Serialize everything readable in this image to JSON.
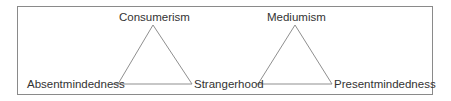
{
  "diagram": {
    "colors": {
      "border": "#8a8a8a",
      "line": "#8f8f8f",
      "text": "#333333"
    },
    "triangles": [
      {
        "top": "Consumerism",
        "left": "Absentmindedness",
        "right": "Strangerhood"
      },
      {
        "top": "Mediumism",
        "left": "Strangerhood",
        "right": "Presentmindedness"
      }
    ]
  }
}
